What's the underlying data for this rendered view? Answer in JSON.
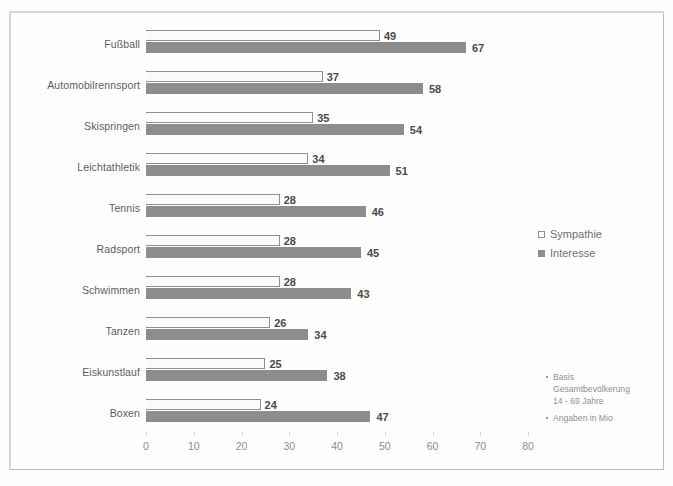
{
  "chart_data": {
    "type": "bar",
    "orientation": "horizontal",
    "title": "",
    "subtitle": "",
    "xlabel": "",
    "ylabel": "",
    "xlim": [
      0,
      80
    ],
    "xticks": [
      0,
      10,
      20,
      30,
      40,
      50,
      60,
      70,
      80
    ],
    "xtick_labels": [
      "0",
      "10",
      "20",
      "30",
      "40",
      "50",
      "60",
      "70",
      "80"
    ],
    "grid": false,
    "legend_position": "right",
    "categories": [
      "Fußball",
      "Automobilrennsport",
      "Skispringen",
      "Leichtathletik",
      "Tennis",
      "Radsport",
      "Schwimmen",
      "Tanzen",
      "Eiskunstlauf",
      "Boxen"
    ],
    "series": [
      {
        "name": "Sympathie",
        "color": "#fbfbfb",
        "border_color": "#8f8f8f",
        "values": [
          49,
          37,
          35,
          34,
          28,
          28,
          28,
          26,
          25,
          24
        ]
      },
      {
        "name": "Interesse",
        "color": "#8d8d8d",
        "border_color": "#8d8d8d",
        "values": [
          67,
          58,
          54,
          51,
          46,
          45,
          43,
          34,
          38,
          47
        ]
      }
    ],
    "annotations": [
      "Basis Gesamtbevölkerung 14 - 69 Jahre",
      "Angaben in Mio"
    ]
  },
  "legend": {
    "items": [
      {
        "label": "Sympathie",
        "marker": "open-square-icon"
      },
      {
        "label": "Interesse",
        "marker": "filled-square-icon"
      }
    ]
  },
  "notes": [
    {
      "lines": [
        "Basis",
        "Gesamtbevölkerung",
        "14 - 69 Jahre"
      ]
    },
    {
      "lines": [
        "Angaben in Mio"
      ]
    }
  ],
  "colors": {
    "sympathie": "#fbfbfb",
    "sympathie_border": "#8f8f8f",
    "interesse": "#8d8d8d",
    "frame": "#b9b9b9",
    "text": "#5d5d5d",
    "axis_text": "#8c8c8c"
  }
}
